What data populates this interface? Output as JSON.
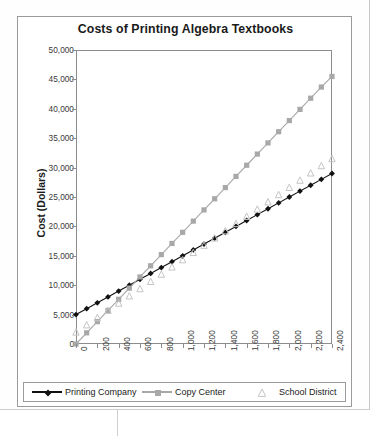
{
  "chart_data": {
    "type": "line",
    "title": "Costs of Printing Algebra Textbooks",
    "xlabel": "Number of Books",
    "ylabel": "Cost (Dollars)",
    "xlim": [
      0,
      2400
    ],
    "ylim": [
      0,
      50000
    ],
    "grid": false,
    "legend_position": "bottom",
    "xticks": [
      "0",
      "200",
      "400",
      "600",
      "800",
      "1,000",
      "1,200",
      "1,400",
      "1,600",
      "1,800",
      "2,000",
      "2,200",
      "2,400"
    ],
    "yticks": [
      "0",
      "5,000",
      "10,000",
      "15,000",
      "20,000",
      "25,000",
      "30,000",
      "35,000",
      "40,000",
      "45,000",
      "50,000"
    ],
    "x": [
      0,
      100,
      200,
      300,
      400,
      500,
      600,
      700,
      800,
      900,
      1000,
      1100,
      1200,
      1300,
      1400,
      1500,
      1600,
      1700,
      1800,
      1900,
      2000,
      2100,
      2200,
      2300,
      2400
    ],
    "series": [
      {
        "name": "Printing Company",
        "color": "#111111",
        "marker": "diamond",
        "line": true,
        "values": [
          5000,
          6000,
          7000,
          8000,
          9000,
          10000,
          11000,
          12000,
          13000,
          14000,
          15000,
          16000,
          17000,
          18000,
          19000,
          20000,
          21000,
          22000,
          23000,
          24000,
          25000,
          26000,
          27000,
          28000,
          29000
        ]
      },
      {
        "name": "Copy Center",
        "color": "#a8a8a8",
        "marker": "square",
        "line": true,
        "values": [
          0,
          1900,
          3800,
          5700,
          7600,
          9500,
          11400,
          13300,
          15200,
          17100,
          19000,
          20900,
          22800,
          24700,
          26600,
          28500,
          30400,
          32300,
          34200,
          36100,
          38000,
          39900,
          41800,
          43700,
          45500
        ]
      },
      {
        "name": "School District",
        "color": "#c4c4c4",
        "marker": "triangle",
        "line": false,
        "values": [
          2000,
          3230,
          4460,
          5690,
          6920,
          8150,
          9380,
          10610,
          11840,
          13070,
          14300,
          15530,
          16760,
          17990,
          19220,
          20450,
          21680,
          22910,
          24140,
          25370,
          26600,
          27830,
          29060,
          30290,
          31500
        ]
      }
    ]
  },
  "legend": {
    "items": [
      {
        "label": "Printing Company"
      },
      {
        "label": "Copy Center"
      },
      {
        "label": "School District"
      }
    ]
  }
}
